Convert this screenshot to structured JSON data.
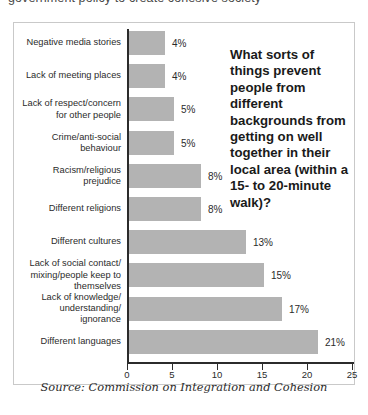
{
  "page": {
    "cutoff_text": "government policy to create cohesive society"
  },
  "figure": {
    "title": "What sorts of things prevent people from different backgrounds from getting on well together in their local area (within a 15- to 20-minute walk)?",
    "source": "Source: Commission on Integration and Cohesion"
  },
  "chart_data": {
    "type": "bar",
    "orientation": "horizontal",
    "title": "What sorts of things prevent people from different backgrounds from getting on well together in their local area (within a 15- to 20-minute walk)?",
    "xlabel": "",
    "ylabel": "",
    "xlim": [
      0,
      25
    ],
    "xticks": [
      0,
      5,
      10,
      15,
      20,
      25
    ],
    "xtick_labels": [
      "0",
      "5",
      "10",
      "15",
      "20",
      "25"
    ],
    "grid": false,
    "legend": false,
    "value_suffix": "%",
    "bar_color": "#b3b3b3",
    "axis_color": "#2b2b2b",
    "categories": [
      "Negative media stories",
      "Lack of meeting places",
      "Lack of respect/concern\nfor other people",
      "Crime/anti-social\nbehaviour",
      "Racism/religious\nprejudice",
      "Different religions",
      "Different cultures",
      "Lack of social contact/\nmixing/people keep to\nthemselves",
      "Lack of knowledge/\nunderstanding/\nignorance",
      "Different languages"
    ],
    "values": [
      4,
      4,
      5,
      5,
      8,
      8,
      13,
      15,
      17,
      21
    ],
    "value_labels": [
      "4%",
      "4%",
      "5%",
      "5%",
      "8%",
      "8%",
      "13%",
      "15%",
      "17%",
      "21%"
    ]
  }
}
